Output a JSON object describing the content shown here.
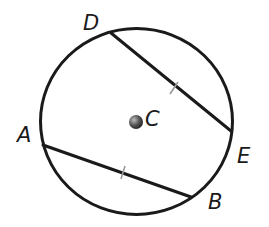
{
  "diagram": {
    "type": "circle-chords",
    "colors": {
      "stroke": "#1a1a1a",
      "tick": "#9a9a9a",
      "center_dot": "#555555"
    },
    "circle": {
      "center_label": "C",
      "cx": 136,
      "cy": 122,
      "r": 95
    },
    "points": [
      {
        "label": "D",
        "x": 111,
        "y": 33
      },
      {
        "label": "E",
        "x": 231,
        "y": 131
      },
      {
        "label": "A",
        "x": 43,
        "y": 145
      },
      {
        "label": "B",
        "x": 191,
        "y": 197
      }
    ],
    "chords": [
      {
        "name": "DE",
        "from": "D",
        "to": "E",
        "tick_mark": true
      },
      {
        "name": "AB",
        "from": "A",
        "to": "B",
        "tick_mark": true
      }
    ],
    "labels": {
      "D": "D",
      "E": "E",
      "A": "A",
      "B": "B",
      "C": "C"
    },
    "note": "Chords DE and AB are marked congruent"
  }
}
